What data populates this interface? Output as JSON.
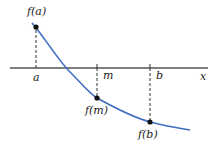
{
  "diagram": {
    "axis_label": "x",
    "labels": {
      "a": "a",
      "m": "m",
      "b": "b",
      "fa": "f(a)",
      "fm": "f(m)",
      "fb": "f(b)"
    },
    "colors": {
      "curve": "#3d6cc0",
      "axis": "#555555",
      "point": "#111111",
      "dashed": "#333333"
    },
    "points": [
      {
        "name": "f(a)",
        "x": "a"
      },
      {
        "name": "f(m)",
        "x": "m"
      },
      {
        "name": "f(b)",
        "x": "b"
      }
    ]
  }
}
